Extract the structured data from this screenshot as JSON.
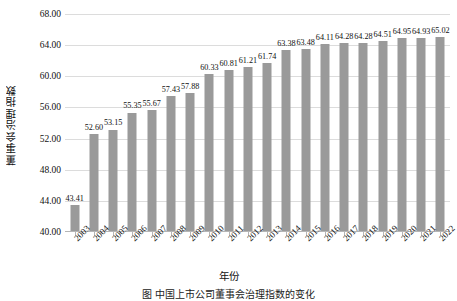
{
  "chart_data": {
    "type": "bar",
    "title": "",
    "xlabel": "年份",
    "ylabel": "董事会治理指数",
    "categories": [
      "2003",
      "2004",
      "2005",
      "2006",
      "2007",
      "2008",
      "2009",
      "2010",
      "2011",
      "2012",
      "2013",
      "2014",
      "2015",
      "2016",
      "2017",
      "2018",
      "2019",
      "2020",
      "2021",
      "2022"
    ],
    "values": [
      43.41,
      52.6,
      53.15,
      55.35,
      55.67,
      57.43,
      57.88,
      60.33,
      60.81,
      61.21,
      61.74,
      63.38,
      63.48,
      64.11,
      64.28,
      64.28,
      64.51,
      64.95,
      64.93,
      65.02
    ],
    "value_labels": [
      "43.41",
      "52.60",
      "53.15",
      "55.35",
      "55.67",
      "57.43",
      "57.88",
      "60.33",
      "60.81",
      "61.21",
      "61.74",
      "63.38",
      "63.48",
      "64.11",
      "64.28",
      "64.28",
      "64.51",
      "64.95",
      "64.93",
      "65.02"
    ],
    "ylim": [
      40.0,
      68.0
    ],
    "ytick_values": [
      40.0,
      44.0,
      48.0,
      52.0,
      56.0,
      60.0,
      64.0,
      68.0
    ],
    "ytick_labels": [
      "40.00",
      "44.00",
      "48.00",
      "52.00",
      "56.00",
      "60.00",
      "64.00",
      "68.00"
    ],
    "grid": "horizontal",
    "legend": "none",
    "bar_color": "#9a9a9a",
    "gridline_color": "#dcdcdc",
    "axis_color": "#b5b5b5"
  },
  "caption": {
    "text": "图 中国上市公司董事会治理指数的变化"
  }
}
